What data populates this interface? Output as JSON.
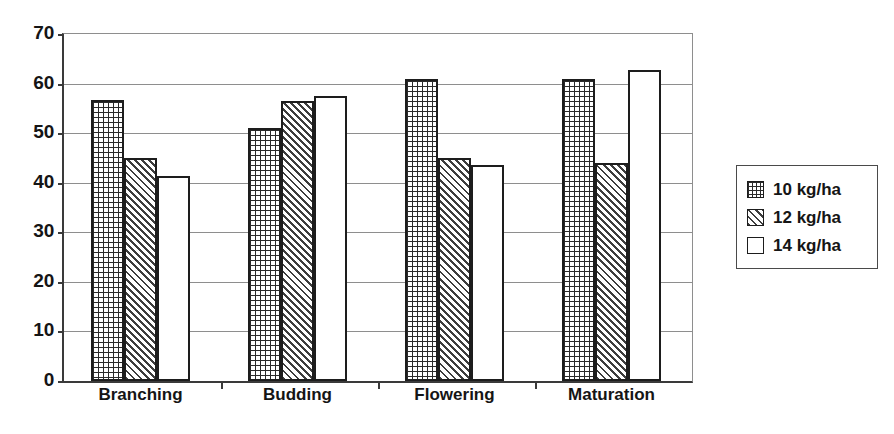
{
  "chart_data": {
    "type": "bar",
    "title": "",
    "subtitle": "",
    "xlabel": "",
    "ylabel": "",
    "categories": [
      "Branching",
      "Budding",
      "Flowering",
      "Maturation"
    ],
    "series": [
      {
        "name": "10 kg/ha",
        "pattern": "grid",
        "values": [
          56.7,
          51.0,
          61.0,
          61.0
        ]
      },
      {
        "name": "12 kg/ha",
        "pattern": "diagonal",
        "values": [
          45.0,
          56.5,
          45.0,
          44.0
        ]
      },
      {
        "name": "14 kg/ha",
        "pattern": "solid-white",
        "values": [
          41.4,
          57.4,
          43.5,
          62.7
        ]
      }
    ],
    "ylim": [
      0,
      70
    ],
    "y_ticks": [
      0,
      10,
      20,
      30,
      40,
      50,
      60,
      70
    ],
    "y_tick_labels": [
      "0",
      "10",
      "20",
      "30",
      "40",
      "50",
      "60",
      "70"
    ],
    "grid": true,
    "legend_position": "right",
    "colors": {
      "axis": "#3a3a3a",
      "gridline": "#8e8e8e",
      "bar_outline": "#1d1d1d",
      "bar_fill": "#ffffff",
      "text": "#151515",
      "background": "#ffffff"
    }
  },
  "legend": {
    "items": [
      {
        "label": "10 kg/ha",
        "pattern": "grid"
      },
      {
        "label": "12 kg/ha",
        "pattern": "diagonal"
      },
      {
        "label": "14 kg/ha",
        "pattern": "solid-white"
      }
    ]
  }
}
